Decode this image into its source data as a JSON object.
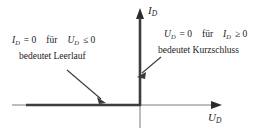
{
  "figure": {
    "kind": "ideal-diode-characteristic-curve",
    "background_color": "#ffffff",
    "ink_color": "#222222",
    "axis_color": "#595959",
    "curve_color": "#3d3d3d"
  },
  "axes": {
    "vertical": {
      "label_var": "I",
      "label_sub": "D",
      "label_text": "I_D",
      "arrow": "up-arrow-icon"
    },
    "horizontal": {
      "label_var": "U",
      "label_sub": "D",
      "label_text": "U_D",
      "arrow": "right-arrow-icon"
    },
    "origin_x": 140,
    "origin_y": 105
  },
  "annotations": {
    "left": {
      "equation": {
        "lhs_var": "I",
        "lhs_sub": "D",
        "lhs_rel": "= 0",
        "conj": "für",
        "rhs_var": "U",
        "rhs_sub": "D",
        "rhs_rel": "≤ 0",
        "full_text": "I_D = 0   für   U_D ≤ 0"
      },
      "caption": "bedeutet Leerlauf",
      "pointer": "arrow-to-negative-voltage-branch"
    },
    "right": {
      "equation": {
        "lhs_var": "U",
        "lhs_sub": "D",
        "lhs_rel": "= 0",
        "conj": "für",
        "rhs_var": "I",
        "rhs_sub": "D",
        "rhs_rel": "≥ 0",
        "full_text": "U_D = 0   für   I_D ≥ 0"
      },
      "caption": "bedeutet Kurzschluss",
      "pointer": "arrow-to-positive-current-branch"
    }
  },
  "curve": {
    "description": "ideal diode characteristic: horizontal segment along negative U_D axis and vertical segment along positive I_D axis",
    "segments": [
      {
        "name": "reverse-blocking-branch",
        "x1": 26,
        "y1": 105,
        "x2": 140,
        "y2": 105
      },
      {
        "name": "forward-conducting-branch",
        "x1": 140,
        "y1": 105,
        "x2": 140,
        "y2": 18
      }
    ]
  }
}
